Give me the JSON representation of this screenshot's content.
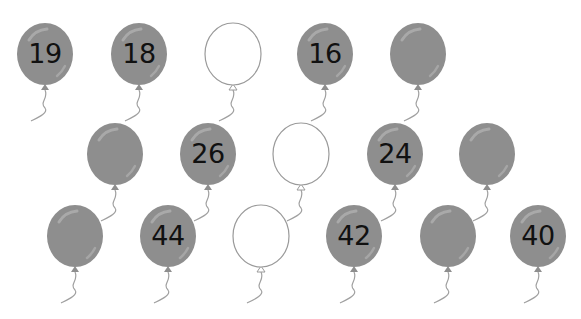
{
  "worksheet": {
    "header_cropped_text": "",
    "colors": {
      "balloon_fill": "#8e8e8e",
      "balloon_highlight": "#b5b5b5",
      "empty_outline": "#9a9a9a",
      "string": "#a0a0a0",
      "number": "#111111"
    },
    "rows": [
      {
        "y": 54,
        "balloons": [
          {
            "x": 45,
            "type": "filled",
            "label": "19"
          },
          {
            "x": 139,
            "type": "filled",
            "label": "18"
          },
          {
            "x": 233,
            "type": "empty",
            "label": ""
          },
          {
            "x": 325,
            "type": "filled",
            "label": "16"
          },
          {
            "x": 418,
            "type": "filled",
            "label": ""
          }
        ]
      },
      {
        "y": 154,
        "balloons": [
          {
            "x": 115,
            "type": "filled",
            "label": ""
          },
          {
            "x": 208,
            "type": "filled",
            "label": "26"
          },
          {
            "x": 301,
            "type": "empty",
            "label": ""
          },
          {
            "x": 395,
            "type": "filled",
            "label": "24"
          },
          {
            "x": 487,
            "type": "filled",
            "label": ""
          }
        ]
      },
      {
        "y": 236,
        "balloons": [
          {
            "x": 75,
            "type": "filled",
            "label": ""
          },
          {
            "x": 168,
            "type": "filled",
            "label": "44"
          },
          {
            "x": 261,
            "type": "empty",
            "label": ""
          },
          {
            "x": 354,
            "type": "filled",
            "label": "42"
          },
          {
            "x": 448,
            "type": "filled",
            "label": ""
          },
          {
            "x": 538,
            "type": "filled",
            "label": "40"
          }
        ]
      }
    ]
  }
}
